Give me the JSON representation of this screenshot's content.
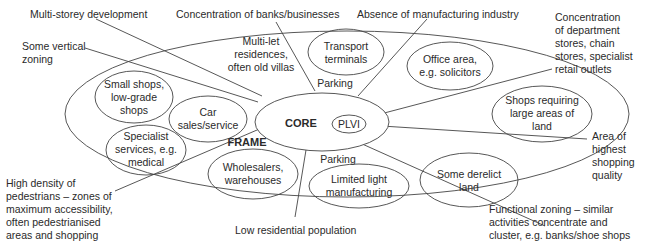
{
  "diagram": {
    "zones": {
      "core": "CORE",
      "plvi": "PLVI",
      "frame": "FRAME"
    },
    "inner_labels": {
      "parking_top": "Parking",
      "parking_bottom": "Parking",
      "multi_let": [
        "Multi-let",
        "residences,",
        "often old villas"
      ]
    },
    "land_uses": [
      {
        "id": "transport",
        "lines": [
          "Transport",
          "terminals"
        ]
      },
      {
        "id": "office",
        "lines": [
          "Office area,",
          "e.g. solicitors"
        ]
      },
      {
        "id": "large-shops",
        "lines": [
          "Shops requiring",
          "large areas of",
          "land"
        ]
      },
      {
        "id": "derelict",
        "lines": [
          "Some derelict",
          "land"
        ]
      },
      {
        "id": "light-manufacturing",
        "lines": [
          "Limited light",
          "manufacturing"
        ]
      },
      {
        "id": "wholesalers",
        "lines": [
          "Wholesalers,",
          "warehouses"
        ]
      },
      {
        "id": "specialist",
        "lines": [
          "Specialist",
          "services, e.g.",
          "medical"
        ]
      },
      {
        "id": "small-shops",
        "lines": [
          "Small shops,",
          "low-grade",
          "shops"
        ]
      },
      {
        "id": "car-sales",
        "lines": [
          "Car",
          "sales/service"
        ]
      }
    ],
    "annotations": [
      {
        "id": "multi-storey",
        "lines": [
          "Multi-storey development"
        ]
      },
      {
        "id": "banks",
        "lines": [
          "Concentration of banks/businesses"
        ]
      },
      {
        "id": "manufacturing",
        "lines": [
          "Absence of manufacturing industry"
        ]
      },
      {
        "id": "department-stores",
        "lines": [
          "Concentration",
          "of department",
          "stores, chain",
          "stores, specialist",
          "retail outlets"
        ]
      },
      {
        "id": "vertical-zoning",
        "lines": [
          "Some vertical",
          "zoning"
        ]
      },
      {
        "id": "shopping-quality",
        "lines": [
          "Area of",
          "highest",
          "shopping",
          "quality"
        ]
      },
      {
        "id": "pedestrians",
        "lines": [
          "High density of",
          "pedestrians – zones of",
          "maximum accessibility,",
          "often pedestrianised",
          "areas and shopping"
        ]
      },
      {
        "id": "residential",
        "lines": [
          "Low residential population"
        ]
      },
      {
        "id": "functional-zoning",
        "lines": [
          "Functional zoning – similar",
          "activities concentrate and",
          "cluster, e.g. banks/shoe shops"
        ]
      }
    ]
  }
}
